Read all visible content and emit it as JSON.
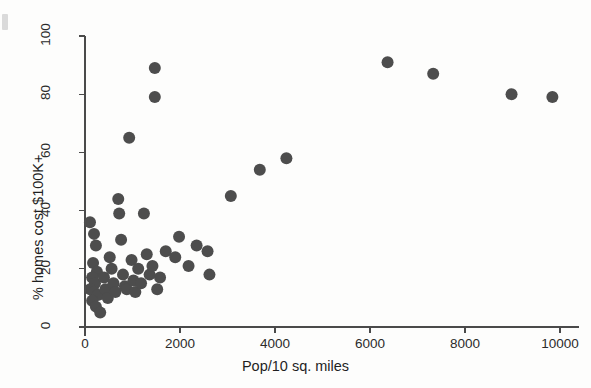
{
  "figure": {
    "background_color": "#fdfdfc",
    "point_color": "#4d4d4d",
    "axis_color": "#4a4a4a"
  },
  "chart_data": {
    "type": "scatter",
    "title": "",
    "xlabel": "Pop/10 sq. miles",
    "ylabel": "% homes cost $100K+",
    "xlim": [
      -200,
      10400
    ],
    "ylim": [
      -3,
      103
    ],
    "xticks": [
      0,
      2000,
      4000,
      6000,
      8000,
      10000
    ],
    "xtick_labels": [
      "0",
      "2000",
      "4000",
      "6000",
      "8000",
      "10000"
    ],
    "yticks": [
      0,
      20,
      40,
      60,
      80,
      100
    ],
    "ytick_labels": [
      "0",
      "20",
      "40",
      "60",
      "80",
      "100"
    ],
    "grid": false,
    "legend": null,
    "marker": "circle",
    "marker_size": 6,
    "points": [
      {
        "x": 105,
        "y": 36
      },
      {
        "x": 190,
        "y": 32
      },
      {
        "x": 230,
        "y": 28
      },
      {
        "x": 170,
        "y": 22
      },
      {
        "x": 250,
        "y": 19
      },
      {
        "x": 150,
        "y": 17
      },
      {
        "x": 210,
        "y": 15
      },
      {
        "x": 110,
        "y": 13
      },
      {
        "x": 190,
        "y": 12
      },
      {
        "x": 270,
        "y": 11
      },
      {
        "x": 150,
        "y": 9
      },
      {
        "x": 230,
        "y": 7
      },
      {
        "x": 320,
        "y": 5
      },
      {
        "x": 400,
        "y": 17
      },
      {
        "x": 430,
        "y": 13
      },
      {
        "x": 480,
        "y": 10
      },
      {
        "x": 520,
        "y": 24
      },
      {
        "x": 560,
        "y": 20
      },
      {
        "x": 600,
        "y": 15
      },
      {
        "x": 640,
        "y": 12
      },
      {
        "x": 700,
        "y": 44
      },
      {
        "x": 720,
        "y": 39
      },
      {
        "x": 760,
        "y": 30
      },
      {
        "x": 800,
        "y": 18
      },
      {
        "x": 840,
        "y": 14
      },
      {
        "x": 880,
        "y": 13
      },
      {
        "x": 930,
        "y": 65
      },
      {
        "x": 980,
        "y": 23
      },
      {
        "x": 1020,
        "y": 16
      },
      {
        "x": 1060,
        "y": 12
      },
      {
        "x": 1120,
        "y": 20
      },
      {
        "x": 1180,
        "y": 15
      },
      {
        "x": 1240,
        "y": 39
      },
      {
        "x": 1300,
        "y": 25
      },
      {
        "x": 1360,
        "y": 18
      },
      {
        "x": 1420,
        "y": 21
      },
      {
        "x": 1470,
        "y": 89
      },
      {
        "x": 1470,
        "y": 79
      },
      {
        "x": 1520,
        "y": 13
      },
      {
        "x": 1580,
        "y": 17
      },
      {
        "x": 1700,
        "y": 26
      },
      {
        "x": 1900,
        "y": 24
      },
      {
        "x": 1980,
        "y": 31
      },
      {
        "x": 2180,
        "y": 21
      },
      {
        "x": 2350,
        "y": 28
      },
      {
        "x": 2580,
        "y": 26
      },
      {
        "x": 2620,
        "y": 18
      },
      {
        "x": 3070,
        "y": 45
      },
      {
        "x": 3680,
        "y": 54
      },
      {
        "x": 4240,
        "y": 58
      },
      {
        "x": 6370,
        "y": 91
      },
      {
        "x": 7330,
        "y": 87
      },
      {
        "x": 8980,
        "y": 80
      },
      {
        "x": 9840,
        "y": 79
      }
    ]
  }
}
